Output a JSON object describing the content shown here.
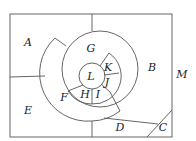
{
  "diagram": {
    "type": "region-map",
    "regions": [
      {
        "id": "A",
        "label": "A"
      },
      {
        "id": "B",
        "label": "B"
      },
      {
        "id": "C",
        "label": "C"
      },
      {
        "id": "D",
        "label": "D"
      },
      {
        "id": "E",
        "label": "E"
      },
      {
        "id": "F",
        "label": "F"
      },
      {
        "id": "G",
        "label": "G"
      },
      {
        "id": "H",
        "label": "H"
      },
      {
        "id": "I",
        "label": "I"
      },
      {
        "id": "J",
        "label": "J"
      },
      {
        "id": "K",
        "label": "K"
      },
      {
        "id": "L",
        "label": "L"
      }
    ],
    "outer_label": "M",
    "line_color": "#555555",
    "text_color": "#222222"
  }
}
